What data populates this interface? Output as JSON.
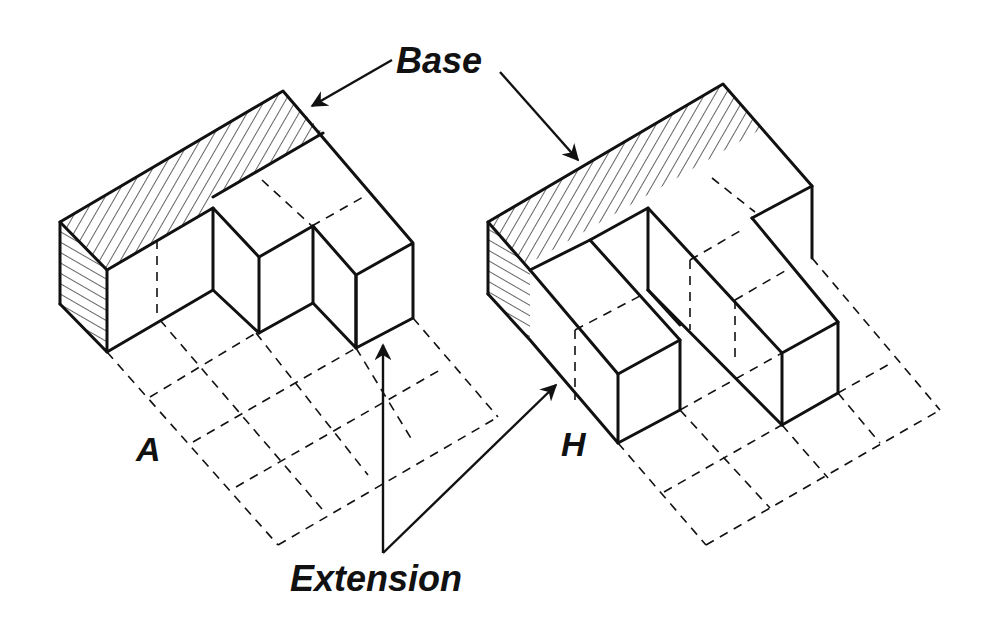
{
  "figure": {
    "labels": {
      "base": "Base",
      "extension": "Extension",
      "figure_a": "A",
      "figure_h": "H"
    },
    "colors": {
      "ink": "#111111",
      "background": "#ffffff"
    },
    "figures": [
      {
        "id": "A",
        "description": "L-shaped solid: hatched base block along back with two extension blocks forward, over a 4x4 dashed floor grid"
      },
      {
        "id": "H",
        "description": "H-shaped solid: hatched base block along back with two parallel extension legs, over a dashed floor grid"
      }
    ]
  }
}
